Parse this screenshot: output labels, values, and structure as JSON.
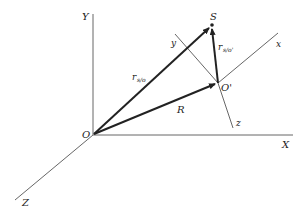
{
  "diagram": {
    "points": {
      "origin": "O",
      "moving_origin": "O'",
      "point": "S"
    },
    "fixed_axes": [
      "X",
      "Y",
      "Z"
    ],
    "moving_axes": [
      "x",
      "y",
      "z"
    ],
    "vectors": [
      {
        "id": "R",
        "from": "O",
        "to": "O'",
        "label": "R",
        "subscript": ""
      },
      {
        "id": "r_s_o",
        "from": "O",
        "to": "S",
        "label": "r",
        "subscript": "s/o"
      },
      {
        "id": "r_s_o_prime",
        "from": "O'",
        "to": "S",
        "label": "r",
        "subscript": "s/o'"
      }
    ],
    "colors": {
      "vector": "#222222",
      "axis": "#555555",
      "background": "#ffffff"
    }
  }
}
